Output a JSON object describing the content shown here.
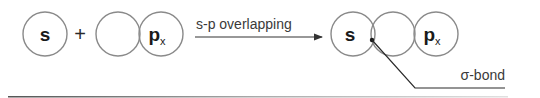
{
  "diagram": {
    "reactants": {
      "s_orbital": {
        "label": "s"
      },
      "plus_sign": "+",
      "p_orbital": {
        "label": "p",
        "subscript": "x"
      }
    },
    "arrow": {
      "label": "s-p overlapping"
    },
    "product": {
      "s_orbital": {
        "label": "s"
      },
      "p_orbital": {
        "label": "p",
        "subscript": "x"
      },
      "bond_label": "σ-bond"
    },
    "colors": {
      "orbital_stroke": "#8a8a8a",
      "text": "#1a1a1a",
      "line": "#333333"
    }
  }
}
